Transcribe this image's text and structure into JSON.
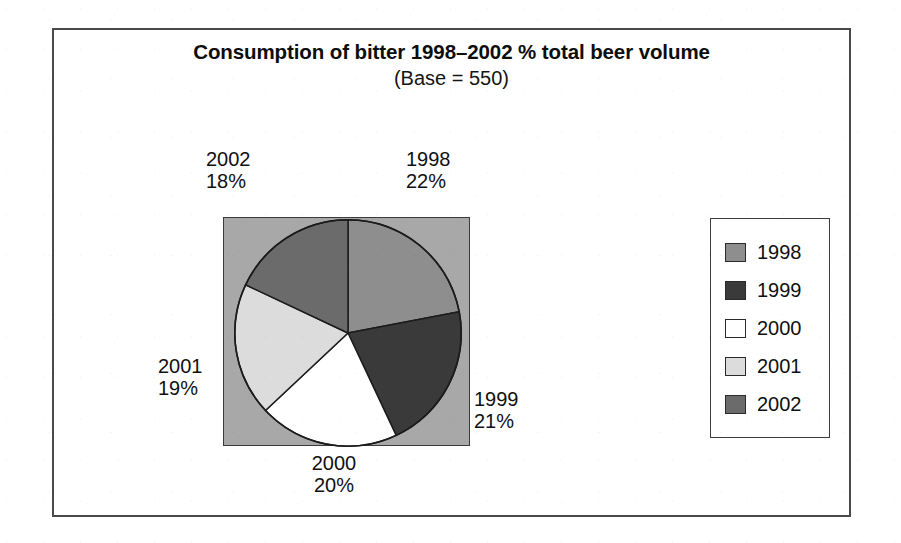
{
  "figure": {
    "title": "Consumption of bitter 1998–2002 % total beer volume",
    "subtitle": "(Base = 550)"
  },
  "chart_data": {
    "type": "pie",
    "title": "Consumption of bitter 1998–2002 % total beer volume",
    "subtitle": "(Base = 550)",
    "base": 550,
    "unit": "%",
    "value_suffix": "%",
    "start_angle_deg": 0,
    "direction": "clockwise",
    "legend_position": "right",
    "grid": false,
    "categories": [
      "1998",
      "1999",
      "2000",
      "2001",
      "2002"
    ],
    "values": [
      22,
      21,
      20,
      19,
      18
    ],
    "colors": [
      "#8e8e8e",
      "#3a3a3a",
      "#ffffff",
      "#dcdcdc",
      "#6b6b6b"
    ],
    "slices": [
      {
        "label": "1998",
        "value": 22,
        "value_text": "22%",
        "color": "#8e8e8e"
      },
      {
        "label": "1999",
        "value": 21,
        "value_text": "21%",
        "color": "#3a3a3a"
      },
      {
        "label": "2000",
        "value": 20,
        "value_text": "20%",
        "color": "#ffffff"
      },
      {
        "label": "2001",
        "value": 19,
        "value_text": "19%",
        "color": "#dcdcdc"
      },
      {
        "label": "2002",
        "value": 18,
        "value_text": "18%",
        "color": "#6b6b6b"
      }
    ],
    "plot_background_color": "#a8a8a8"
  },
  "labels": {
    "y1998": {
      "name": "1998",
      "value": "22%"
    },
    "y1999": {
      "name": "1999",
      "value": "21%"
    },
    "y2000": {
      "name": "2000",
      "value": "20%"
    },
    "y2001": {
      "name": "2001",
      "value": "19%"
    },
    "y2002": {
      "name": "2002",
      "value": "18%"
    }
  },
  "legend": {
    "items": [
      {
        "label": "1998",
        "color": "#8e8e8e"
      },
      {
        "label": "1999",
        "color": "#3a3a3a"
      },
      {
        "label": "2000",
        "color": "#ffffff"
      },
      {
        "label": "2001",
        "color": "#dcdcdc"
      },
      {
        "label": "2002",
        "color": "#6b6b6b"
      }
    ]
  }
}
